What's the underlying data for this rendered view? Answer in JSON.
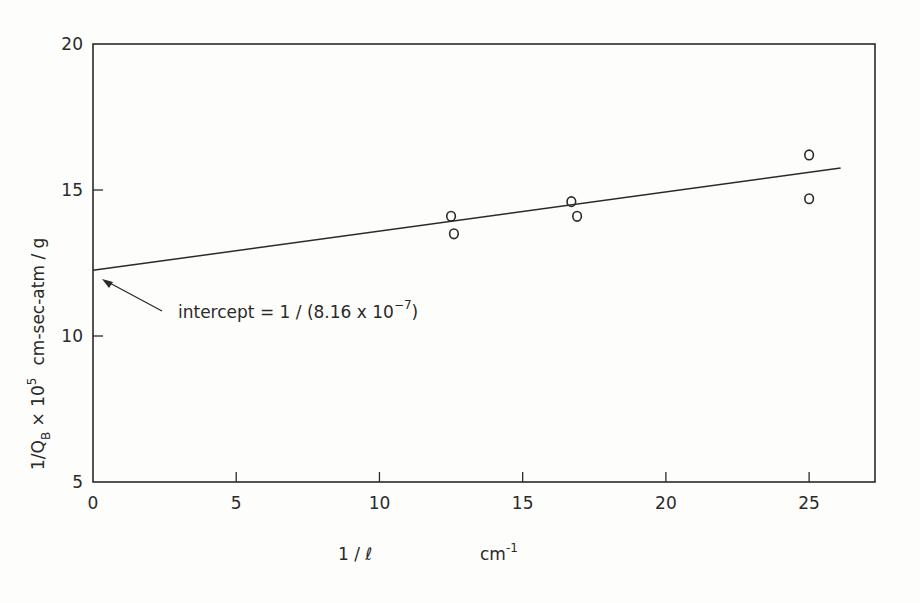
{
  "chart_data": {
    "type": "scatter",
    "title": "",
    "xlabel": "1 / ℓ",
    "xlabel_units": "cm⁻¹",
    "ylabel": "1/Q_B × 10⁵  cm-sec-atm / g",
    "xlim": [
      0,
      27.3
    ],
    "ylim": [
      5,
      20
    ],
    "x_ticks": [
      "0",
      "5",
      "10",
      "15",
      "20",
      "25"
    ],
    "y_ticks": [
      "5",
      "10",
      "15",
      "20"
    ],
    "grid": false,
    "series": [
      {
        "name": "measurements",
        "marker": "open-circle",
        "points": [
          [
            12.5,
            14.1
          ],
          [
            12.6,
            13.5
          ],
          [
            16.7,
            14.6
          ],
          [
            16.9,
            14.1
          ],
          [
            25.0,
            16.2
          ],
          [
            25.0,
            14.7
          ]
        ]
      },
      {
        "name": "fit",
        "style": "line",
        "points": [
          [
            0,
            12.25
          ],
          [
            26.1,
            15.75
          ]
        ]
      }
    ],
    "annotations": [
      {
        "text": "intercept = 1 / (8.16 × 10⁻⁷)",
        "points_to": [
          0,
          12.25
        ]
      }
    ]
  },
  "labels": {
    "x_axis_main": "1 / ℓ",
    "x_axis_units": "cm",
    "x_axis_units_exp": "-1",
    "y_axis_main": "1/Q",
    "y_axis_sub": "B",
    "y_axis_mult": " × 10",
    "y_axis_exp": "5",
    "y_axis_units": "cm-sec-atm / g",
    "intercept_text": "intercept = 1 / (8.16 x 10",
    "intercept_exp": "−7",
    "intercept_close": ")"
  }
}
